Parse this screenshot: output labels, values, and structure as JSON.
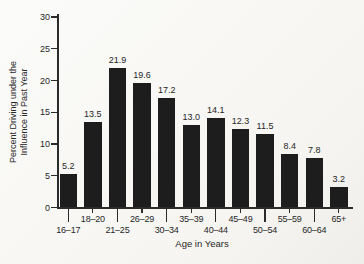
{
  "figure": {
    "background": "#f7f6f3",
    "bar_color": "#1d1d1d",
    "axis_color": "#2b2b2b",
    "text_color": "#262626"
  },
  "chart_data": {
    "type": "bar",
    "title": "",
    "xlabel": "Age in Years",
    "ylabel": "Percent Driving under the Influence in Past Year",
    "ylabel_lines": [
      "Percent Driving under the",
      "Influence in Past Year"
    ],
    "categories": [
      "16–17",
      "18–20",
      "21–25",
      "26–29",
      "30–34",
      "35–39",
      "40–44",
      "45–49",
      "50–54",
      "55–59",
      "60–64",
      "65+"
    ],
    "values": [
      5.2,
      13.5,
      21.9,
      19.6,
      17.2,
      13.0,
      14.1,
      12.3,
      11.5,
      8.4,
      7.8,
      3.2
    ],
    "value_labels": [
      "5.2",
      "13.5",
      "21.9",
      "19.6",
      "17.2",
      "13.0",
      "14.1",
      "12.3",
      "11.5",
      "8.4",
      "7.8",
      "3.2"
    ],
    "y_ticks": [
      0,
      5,
      10,
      15,
      20,
      25,
      30
    ],
    "ylim": [
      0,
      30
    ],
    "grid": false,
    "legend_position": "none",
    "bar_labels_shown": true,
    "x_labels_staggered": true
  }
}
